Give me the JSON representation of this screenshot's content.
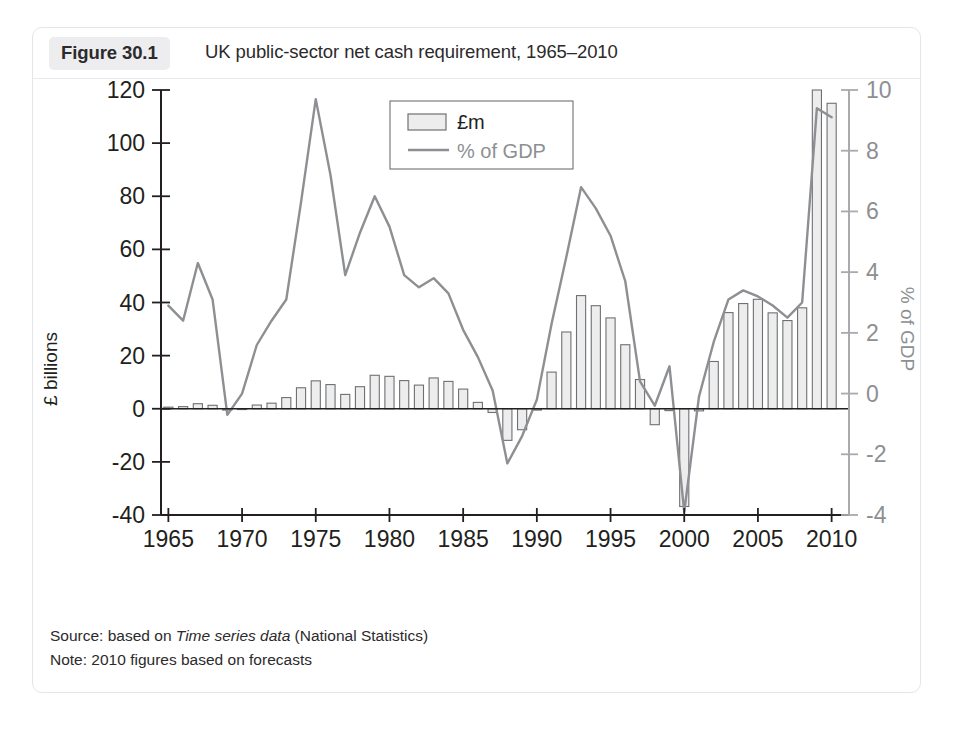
{
  "figure": {
    "badge": "Figure 30.1",
    "title": "UK public-sector net cash requirement, 1965–2010"
  },
  "footnotes": {
    "source_prefix": "Source: based on ",
    "source_italic": "Time series data",
    "source_suffix": " (National Statistics)",
    "note": "Note: 2010 figures based on forecasts"
  },
  "colors": {
    "bar_fill": "#ededed",
    "bar_stroke": "#6e7073",
    "line": "#8d8f92",
    "axis": "#231f20",
    "axis_right": "#a8aaad",
    "badge_bg": "#ededef",
    "card_border": "#e3e5e8"
  },
  "chart_data": {
    "type": "bar",
    "title": "UK public-sector net cash requirement, 1965–2010",
    "xlabel": "",
    "ylabel": "£ billions",
    "y2label": "% of GDP",
    "ylim": [
      -40,
      120
    ],
    "y2lim": [
      -4,
      10
    ],
    "yticks": [
      -40,
      -20,
      0,
      20,
      40,
      60,
      80,
      100,
      120
    ],
    "y2ticks": [
      -4,
      -2,
      0,
      2,
      4,
      6,
      8,
      10
    ],
    "xticks": [
      1965,
      1970,
      1975,
      1980,
      1985,
      1990,
      1995,
      2000,
      2005,
      2010
    ],
    "xlim": [
      1964.5,
      2010.5
    ],
    "grid": false,
    "legend_position": "top-center",
    "legend": [
      "£m",
      "% of GDP"
    ],
    "x": [
      1965,
      1966,
      1967,
      1968,
      1969,
      1970,
      1971,
      1972,
      1973,
      1974,
      1975,
      1976,
      1977,
      1978,
      1979,
      1980,
      1981,
      1982,
      1983,
      1984,
      1985,
      1986,
      1987,
      1988,
      1989,
      1990,
      1991,
      1992,
      1993,
      1994,
      1995,
      1996,
      1997,
      1998,
      1999,
      2000,
      2001,
      2002,
      2003,
      2004,
      2005,
      2006,
      2007,
      2008,
      2009,
      2010
    ],
    "series": [
      {
        "name": "£m",
        "axis": "left",
        "units": "£ billions",
        "values": [
          0.6,
          0.8,
          1.9,
          1.3,
          -0.5,
          0.0,
          1.4,
          2.1,
          4.2,
          7.9,
          10.5,
          9.1,
          5.4,
          8.3,
          12.6,
          12.2,
          10.6,
          8.9,
          11.6,
          10.3,
          7.4,
          2.4,
          -1.4,
          -11.9,
          -7.9,
          -0.5,
          13.8,
          28.9,
          42.6,
          38.8,
          34.2,
          24.1,
          11.0,
          -6.0,
          -0.7,
          -36.8,
          -0.8,
          17.8,
          36.2,
          39.6,
          41.2,
          36.1,
          33.2,
          38.0,
          120.0,
          115.0
        ]
      },
      {
        "name": "% of GDP",
        "axis": "right",
        "units": "% of GDP",
        "values": [
          2.9,
          2.4,
          4.3,
          3.1,
          -0.7,
          0.0,
          1.6,
          2.4,
          3.1,
          6.3,
          9.7,
          7.2,
          3.9,
          5.3,
          6.5,
          5.5,
          3.9,
          3.5,
          3.8,
          3.3,
          2.1,
          1.2,
          0.1,
          -2.3,
          -1.4,
          -0.2,
          2.3,
          4.5,
          6.8,
          6.1,
          5.2,
          3.7,
          0.4,
          -0.4,
          0.9,
          -3.9,
          -0.1,
          1.7,
          3.1,
          3.4,
          3.2,
          2.9,
          2.5,
          3.0,
          9.4,
          9.1
        ]
      }
    ]
  }
}
